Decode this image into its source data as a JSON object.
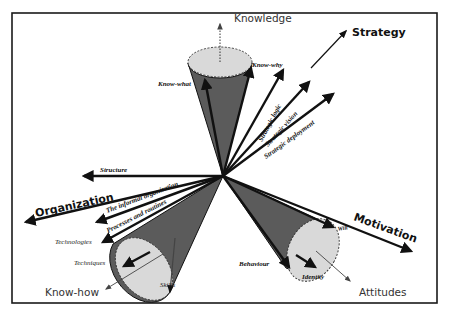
{
  "diagram": {
    "type": "three-cone vector diagram",
    "frame": {
      "x": 12,
      "y": 13,
      "width": 425,
      "height": 290
    },
    "center": {
      "x": 223,
      "y": 176
    },
    "colors": {
      "line": "#111111",
      "cone_fill": "#5b5b5b",
      "cap_fill": "#d9d9d9",
      "background": "#ffffff"
    },
    "main_axes": {
      "strategy": "Strategy",
      "organization": "Organization",
      "motivation": "Motivation"
    },
    "cones": {
      "knowledge": {
        "title": "Knowledge",
        "labels": [
          "Know-what",
          "Know-why"
        ]
      },
      "know_how": {
        "title": "Know-how",
        "labels": [
          "Technologies",
          "Techniques",
          "Skills"
        ]
      },
      "attitudes": {
        "title": "Attitudes",
        "labels": [
          "Behaviour",
          "Identity",
          "Will"
        ]
      }
    },
    "strategy_vectors": [
      "Strategic logic",
      "Strategic vision",
      "Strategic deployment"
    ],
    "organization_vectors": [
      "Structure",
      "The informal organization",
      "Processes and routines"
    ]
  }
}
